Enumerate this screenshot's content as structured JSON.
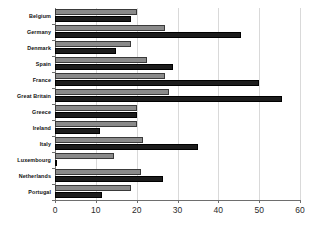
{
  "chart_data": {
    "type": "bar",
    "orientation": "horizontal",
    "title": "",
    "xlabel": "",
    "ylabel": "",
    "xlim": [
      0,
      60
    ],
    "xticks": [
      0,
      10,
      20,
      30,
      40,
      50,
      60
    ],
    "grid": true,
    "legend": "none",
    "categories": [
      "Belgium",
      "Germany",
      "Denmark",
      "Spain",
      "France",
      "Great Britain",
      "Greece",
      "Ireland",
      "Italy",
      "Luxembourg",
      "Netherlands",
      "Portugal"
    ],
    "series": [
      {
        "name": "series-a",
        "color": "#8a8a8a",
        "values": [
          20,
          27,
          18.5,
          22.5,
          27,
          28,
          20,
          20,
          21.5,
          14.5,
          21,
          18.5
        ]
      },
      {
        "name": "series-b",
        "color": "#1c1c1c",
        "values": [
          18.5,
          45.5,
          15,
          29,
          50,
          55.5,
          20,
          11,
          35,
          0.5,
          26.5,
          11.5
        ]
      }
    ]
  },
  "axis": {
    "tick_labels": [
      "0",
      "10",
      "20",
      "30",
      "40",
      "50",
      "60"
    ]
  }
}
